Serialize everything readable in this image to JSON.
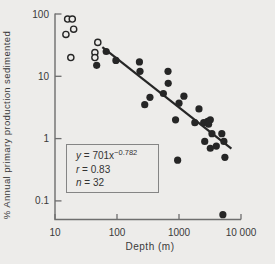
{
  "figure": {
    "background": "#edecea",
    "ink": "#262626",
    "text_color": "#3a3a3a",
    "axis_color": "#6e6e6e",
    "box_border": "#858585"
  },
  "chart_data": {
    "type": "scatter",
    "title": "",
    "xlabel": "Depth (m)",
    "ylabel": "% Annual primary production sedimented",
    "x_scale": "log",
    "y_scale": "log",
    "xlim": [
      10,
      10000
    ],
    "ylim": [
      0.05,
      100
    ],
    "grid": false,
    "legend_position": "none",
    "x_ticks": [
      {
        "value": 10,
        "label": "10"
      },
      {
        "value": 100,
        "label": "100"
      },
      {
        "value": 1000,
        "label": "1000"
      },
      {
        "value": 10000,
        "label": "10 000"
      }
    ],
    "y_ticks": [
      {
        "value": 100,
        "label": "100"
      },
      {
        "value": 10,
        "label": "10"
      },
      {
        "value": 1,
        "label": "1"
      },
      {
        "value": 0.1,
        "label": "0.1"
      }
    ],
    "series": [
      {
        "name": "open-circle-stations",
        "marker": "open-circle",
        "points": [
          [
            16,
            83
          ],
          [
            19,
            83
          ],
          [
            20,
            57
          ],
          [
            15,
            47
          ],
          [
            18,
            20
          ],
          [
            49,
            35
          ],
          [
            44,
            24
          ],
          [
            44,
            20
          ]
        ]
      },
      {
        "name": "filled-circle-stations",
        "marker": "filled-circle",
        "points": [
          [
            67,
            25
          ],
          [
            96,
            18
          ],
          [
            47,
            15
          ],
          [
            230,
            17
          ],
          [
            235,
            12
          ],
          [
            560,
            5.3
          ],
          [
            665,
            12
          ],
          [
            670,
            7.7
          ],
          [
            340,
            4.6
          ],
          [
            280,
            3.5
          ],
          [
            1200,
            4.8
          ],
          [
            1000,
            3.7
          ],
          [
            2100,
            3.0
          ],
          [
            880,
            2.0
          ],
          [
            1800,
            1.8
          ],
          [
            2500,
            1.8
          ],
          [
            2900,
            1.9
          ],
          [
            3200,
            2.0
          ],
          [
            3000,
            1.7
          ],
          [
            3400,
            1.2
          ],
          [
            4900,
            1.2
          ],
          [
            2600,
            0.9
          ],
          [
            4000,
            0.76
          ],
          [
            3200,
            0.7
          ],
          [
            5300,
            0.9
          ],
          [
            5500,
            0.5
          ],
          [
            950,
            0.45
          ],
          [
            5100,
            0.06
          ]
        ]
      }
    ],
    "fit": {
      "a": 701,
      "b": -0.782,
      "x_start": 58,
      "x_end": 7000
    },
    "stats": {
      "r": 0.83,
      "n": 32
    }
  },
  "equation_box": {
    "line1": {
      "var": "y",
      "eq": " = 701x",
      "sup": "−0.782"
    },
    "line2": {
      "var": "r",
      "eq": " = 0.83"
    },
    "line3": {
      "var": "n",
      "eq": " = 32"
    }
  }
}
